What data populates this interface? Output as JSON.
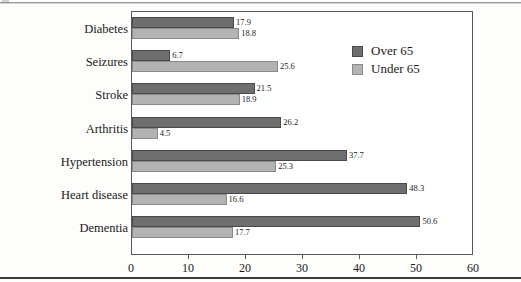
{
  "chart_data": {
    "type": "bar",
    "orientation": "horizontal",
    "title": "",
    "xlabel": "",
    "ylabel": "",
    "xlim": [
      0,
      60
    ],
    "xticks": [
      0,
      10,
      20,
      30,
      40,
      50,
      60
    ],
    "xtick_labels": [
      "0",
      "10",
      "20",
      "30",
      "40",
      "50",
      "60"
    ],
    "grid": false,
    "legend_position": "upper-right-inside",
    "categories": [
      "Diabetes",
      "Seizures",
      "Stroke",
      "Arthritis",
      "Hypertension",
      "Heart disease",
      "Dementia"
    ],
    "series": [
      {
        "name": "Over 65",
        "color": "#6e6e6e",
        "values": [
          17.9,
          6.7,
          21.5,
          26.2,
          37.7,
          48.3,
          50.6
        ],
        "labels": [
          "17.9",
          "6.7",
          "21.5",
          "26.2",
          "37.7",
          "48.3",
          "50.6"
        ]
      },
      {
        "name": "Under 65",
        "color": "#b3b3b3",
        "values": [
          18.8,
          25.6,
          18.9,
          4.5,
          25.3,
          16.6,
          17.7
        ],
        "labels": [
          "18.8",
          "25.6",
          "18.9",
          "4.5",
          "25.3",
          "16.6",
          "17.7"
        ]
      }
    ]
  },
  "legend": {
    "items": [
      {
        "label": "Over 65",
        "color": "#6e6e6e"
      },
      {
        "label": "Under 65",
        "color": "#b3b3b3"
      }
    ]
  },
  "colors": {
    "over_65": "#6e6e6e",
    "under_65": "#b3b3b3",
    "frame": "#5a5a5a",
    "text": "#1b1b1b",
    "page_background": "#fdfdfc"
  }
}
